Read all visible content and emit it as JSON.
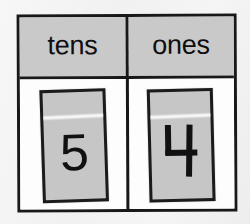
{
  "worksheet": {
    "type": "place-value-chart",
    "represented_number": "54",
    "colors": {
      "page_background": "#f2f2f2",
      "chart_background": "#fdfdfd",
      "frame_line": "#18181a",
      "header_fill": "#c9c9c9",
      "card_fill": "#c6c6c6",
      "ink": "#111113"
    }
  },
  "header": {
    "columns": [
      {
        "key": "tens",
        "label": "tens"
      },
      {
        "key": "ones",
        "label": "ones"
      }
    ]
  },
  "body": {
    "cards": [
      {
        "column": "tens",
        "digit": "5",
        "glyph_style": "typeset",
        "place_value": 50
      },
      {
        "column": "ones",
        "digit": "4",
        "glyph_style": "open-top-handwritten",
        "place_value": 4
      }
    ]
  }
}
